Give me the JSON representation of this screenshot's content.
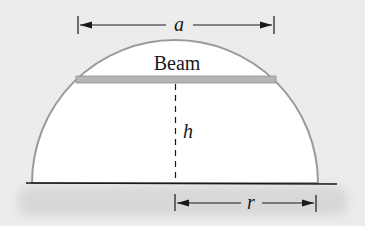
{
  "diagram": {
    "beam_label": "Beam",
    "width_label": "a",
    "height_label": "h",
    "radius_label": "r",
    "colors": {
      "background": "#ececec",
      "ground_shadow": "#dcdcdc",
      "arch_fill": "#ffffff",
      "arch_stroke": "#9a9a9a",
      "beam_fill": "#b5b5b5",
      "line": "#1a1a1a"
    }
  }
}
